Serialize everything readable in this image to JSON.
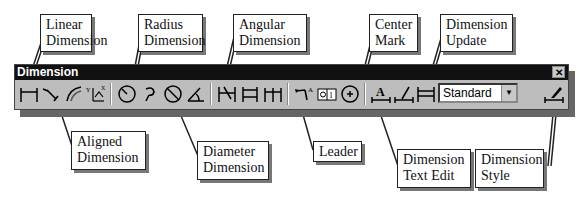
{
  "toolbar": {
    "title": "Dimension",
    "close_label": "✕",
    "style_combo": {
      "selected": "Standard",
      "arrow": "▼"
    },
    "buttons": [
      {
        "name": "linear-dimension",
        "tooltip": "Linear Dimension"
      },
      {
        "name": "aligned-dimension",
        "tooltip": "Aligned Dimension"
      },
      {
        "name": "arc-length-dimension",
        "tooltip": ""
      },
      {
        "name": "ordinate-dimension",
        "tooltip": ""
      },
      {
        "name": "radius-dimension",
        "tooltip": "Radius Dimension"
      },
      {
        "name": "jogged-dimension",
        "tooltip": ""
      },
      {
        "name": "diameter-dimension",
        "tooltip": "Diameter Dimension"
      },
      {
        "name": "angular-dimension",
        "tooltip": "Angular Dimension"
      },
      {
        "name": "quick-dimension",
        "tooltip": ""
      },
      {
        "name": "baseline-dimension",
        "tooltip": ""
      },
      {
        "name": "continue-dimension",
        "tooltip": ""
      },
      {
        "name": "leader",
        "tooltip": "Leader"
      },
      {
        "name": "tolerance",
        "tooltip": ""
      },
      {
        "name": "center-mark",
        "tooltip": "Center Mark"
      },
      {
        "name": "dimension-text-edit",
        "tooltip": "Dimension Text Edit"
      },
      {
        "name": "dimension-edit",
        "tooltip": ""
      },
      {
        "name": "dimension-update",
        "tooltip": "Dimension Update"
      },
      {
        "name": "dimension-style",
        "tooltip": "Dimension Style"
      }
    ]
  },
  "callouts": {
    "linear": [
      "Linear",
      "Dimension"
    ],
    "radius": [
      "Radius",
      "Dimension"
    ],
    "angular": [
      "Angular",
      "Dimension"
    ],
    "center_mark": [
      "Center",
      "Mark"
    ],
    "dimension_update": [
      "Dimension",
      "Update"
    ],
    "aligned": [
      "Aligned",
      "Dimension"
    ],
    "diameter": [
      "Diameter",
      "Dimension"
    ],
    "leader": [
      "Leader"
    ],
    "dimension_text_edit": [
      "Dimension",
      "Text Edit"
    ],
    "dimension_style": [
      "Dimension",
      "Style"
    ]
  }
}
